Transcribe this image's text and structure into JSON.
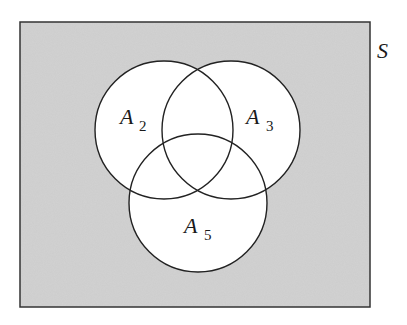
{
  "diagram": {
    "type": "venn",
    "universe": {
      "label": "S",
      "fill": "#d2d2d2",
      "stroke": "#333333",
      "x": 20,
      "y": 22,
      "width": 350,
      "height": 285
    },
    "sets": [
      {
        "id": "A2",
        "name": "A",
        "subscript": "2",
        "cx": 164,
        "cy": 130,
        "r": 69,
        "label_x": 120,
        "label_y": 124,
        "sub_x": 141,
        "sub_y": 129
      },
      {
        "id": "A3",
        "name": "A",
        "subscript": "3",
        "cx": 231,
        "cy": 130,
        "r": 69,
        "label_x": 247,
        "label_y": 124,
        "sub_x": 268,
        "sub_y": 129
      },
      {
        "id": "A5",
        "name": "A",
        "subscript": "5",
        "cx": 198,
        "cy": 203,
        "r": 69,
        "label_x": 185,
        "label_y": 233,
        "sub_x": 205,
        "sub_y": 238
      }
    ],
    "circle_fill": "#ffffff",
    "circle_stroke": "#222222"
  }
}
